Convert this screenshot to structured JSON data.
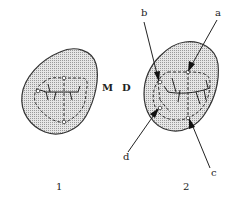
{
  "figure": {
    "type": "dental occlusal view diagram",
    "colors": {
      "fill": "#d8d8d8",
      "stroke": "#333333",
      "background": "#ffffff"
    }
  },
  "tooth1": {
    "caption": "1",
    "side_label": "M"
  },
  "tooth2": {
    "caption": "2",
    "side_label": "D",
    "pointers": [
      {
        "label": "a"
      },
      {
        "label": "b"
      },
      {
        "label": "c"
      },
      {
        "label": "d"
      }
    ]
  }
}
